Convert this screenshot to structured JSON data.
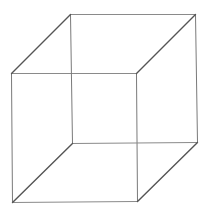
{
  "diagram": {
    "type": "necker-cube",
    "background": "#ffffff",
    "vertices": {
      "front_top_left": [
        11,
        73
      ],
      "front_top_right": [
        136,
        73
      ],
      "front_bottom_left": [
        12,
        202
      ],
      "front_bottom_right": [
        137,
        201
      ],
      "back_top_left": [
        70,
        14
      ],
      "back_top_right": [
        195,
        14
      ],
      "back_bottom_left": [
        72,
        143
      ],
      "back_bottom_right": [
        197,
        142
      ]
    },
    "edges": {
      "front_top": {
        "from": "front_top_left",
        "to": "front_top_right",
        "color": "#8a8a8a",
        "width": 1
      },
      "front_bottom": {
        "from": "front_bottom_left",
        "to": "front_bottom_right",
        "color": "#8a8a8a",
        "width": 1
      },
      "front_left": {
        "from": "front_top_left",
        "to": "front_bottom_left",
        "color": "#7a7a7a",
        "width": 1
      },
      "front_right": {
        "from": "front_top_right",
        "to": "front_bottom_right",
        "color": "#7a7a7a",
        "width": 1
      },
      "back_top": {
        "from": "back_top_left",
        "to": "back_top_right",
        "color": "#8a8a8a",
        "width": 1
      },
      "back_bottom": {
        "from": "back_bottom_left",
        "to": "back_bottom_right",
        "color": "#8a8a8a",
        "width": 1
      },
      "back_left": {
        "from": "back_top_left",
        "to": "back_bottom_left",
        "color": "#7a7a7a",
        "width": 1
      },
      "back_right": {
        "from": "back_top_right",
        "to": "back_bottom_right",
        "color": "#7a7a7a",
        "width": 1
      },
      "depth_top_left": {
        "from": "front_top_left",
        "to": "back_top_left",
        "color": "#555555",
        "width": 1.4
      },
      "depth_top_right": {
        "from": "front_top_right",
        "to": "back_top_right",
        "color": "#555555",
        "width": 1.4
      },
      "depth_bottom_left": {
        "from": "front_bottom_left",
        "to": "back_bottom_left",
        "color": "#555555",
        "width": 1.4
      },
      "depth_bottom_right": {
        "from": "front_bottom_right",
        "to": "back_bottom_right",
        "color": "#555555",
        "width": 1.4
      }
    }
  }
}
